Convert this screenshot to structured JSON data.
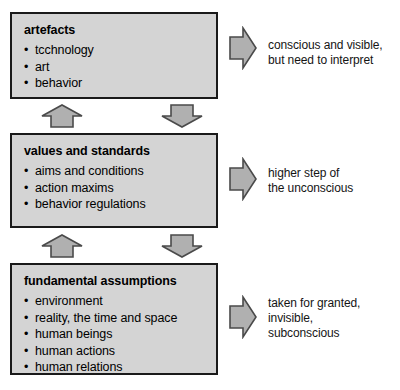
{
  "diagram": {
    "levels": [
      {
        "title": "artefacts",
        "bullets": [
          "tcchnology",
          "art",
          "behavior"
        ],
        "caption": "conscious and visible,\nbut need to interpret"
      },
      {
        "title": "values and standards",
        "bullets": [
          "aims and conditions",
          "action maxims",
          "behavior regulations"
        ],
        "caption": "higher step of\nthe unconscious"
      },
      {
        "title": "fundamental assumptions",
        "bullets": [
          "environment",
          "reality, the time and space",
          "human beings",
          "human actions",
          "human relations"
        ],
        "caption": "taken for granted,\ninvisible,\nsubconscious"
      }
    ],
    "connectors": [
      {
        "icon": "arrow-up-icon",
        "direction": "up"
      },
      {
        "icon": "arrow-down-icon",
        "direction": "down"
      },
      {
        "icon": "arrow-up-icon",
        "direction": "up"
      },
      {
        "icon": "arrow-down-icon",
        "direction": "down"
      }
    ],
    "caption_arrows": [
      {
        "icon": "arrow-right-icon",
        "direction": "right"
      },
      {
        "icon": "arrow-right-icon",
        "direction": "right"
      },
      {
        "icon": "arrow-right-icon",
        "direction": "right"
      }
    ],
    "colors": {
      "box_fill": "#d4d4d4",
      "box_border": "#1a1a1a",
      "arrow_fill": "#b0b0b0",
      "arrow_border": "#4a4a4a",
      "text": "#000000",
      "background": "#ffffff"
    }
  }
}
